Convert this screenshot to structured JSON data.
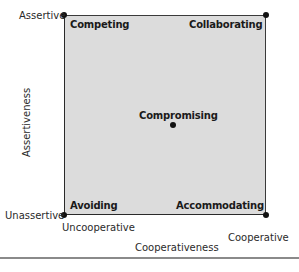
{
  "diagram": {
    "type": "quadrant",
    "quadrants": {
      "top_left": "Competing",
      "top_right": "Collaborating",
      "center": "Compromising",
      "bottom_left": "Avoiding",
      "bottom_right": "Accommodating"
    },
    "y_axis": {
      "title": "Assertiveness",
      "top": "Assertive",
      "bottom": "Unassertive"
    },
    "x_axis": {
      "title": "Cooperativeness",
      "left": "Uncooperative",
      "right": "Cooperative"
    },
    "colors": {
      "box_fill": "#dcdcdc",
      "border": "#2a2a2a",
      "dot": "#111111"
    }
  }
}
